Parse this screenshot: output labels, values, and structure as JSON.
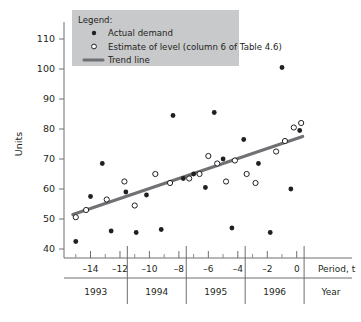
{
  "chart_data": {
    "type": "scatter",
    "title": "",
    "xlabel": "Period, t",
    "ylabel": "Units",
    "xlim": [
      -15.8,
      0.9
    ],
    "ylim": [
      37,
      113
    ],
    "grid": false,
    "x_ticks": [
      -14,
      -12,
      -10,
      -8,
      -6,
      -4,
      -2,
      0
    ],
    "x_tick_labels": [
      "–14",
      "–12",
      "–10",
      "–8",
      "–6",
      "–4",
      "–2",
      "0"
    ],
    "x_minor_ticks": [
      -15,
      -13,
      -11,
      -9,
      -7,
      -5,
      -3,
      -1
    ],
    "y_ticks": [
      40,
      50,
      60,
      70,
      80,
      90,
      100,
      110
    ],
    "y_tick_labels": [
      "40",
      "50",
      "60",
      "70",
      "80",
      "90",
      "100",
      "110"
    ],
    "second_axis_label": "Year",
    "year_bands": [
      {
        "label": "1993",
        "start": -15.8,
        "end": -11.5
      },
      {
        "label": "1994",
        "start": -11.5,
        "end": -7.5
      },
      {
        "label": "1995",
        "start": -7.5,
        "end": -3.5
      },
      {
        "label": "1996",
        "start": -3.5,
        "end": 0.5
      }
    ],
    "series": [
      {
        "name": "Actual demand",
        "marker": "filled-circle",
        "color": "#231f20",
        "points": [
          {
            "x": -15.0,
            "y": 42.5
          },
          {
            "x": -14.0,
            "y": 57.5
          },
          {
            "x": -13.2,
            "y": 68.5
          },
          {
            "x": -12.6,
            "y": 46.0
          },
          {
            "x": -11.6,
            "y": 59.0
          },
          {
            "x": -10.9,
            "y": 45.5
          },
          {
            "x": -10.2,
            "y": 58.0
          },
          {
            "x": -9.2,
            "y": 46.5
          },
          {
            "x": -8.4,
            "y": 84.5
          },
          {
            "x": -7.7,
            "y": 63.5
          },
          {
            "x": -7.0,
            "y": 65.0
          },
          {
            "x": -6.2,
            "y": 60.5
          },
          {
            "x": -5.6,
            "y": 85.5
          },
          {
            "x": -5.0,
            "y": 70.0
          },
          {
            "x": -4.4,
            "y": 47.0
          },
          {
            "x": -3.6,
            "y": 76.5
          },
          {
            "x": -2.6,
            "y": 68.5
          },
          {
            "x": -1.8,
            "y": 45.5
          },
          {
            "x": -1.0,
            "y": 100.5
          },
          {
            "x": -0.4,
            "y": 60.0
          },
          {
            "x": 0.2,
            "y": 79.5
          }
        ]
      },
      {
        "name": "Estimate of level (column 6 of Table 4.6)",
        "marker": "open-circle",
        "color": "#231f20",
        "points": [
          {
            "x": -15.0,
            "y": 50.6
          },
          {
            "x": -14.3,
            "y": 53.0
          },
          {
            "x": -12.9,
            "y": 56.5
          },
          {
            "x": -11.7,
            "y": 62.5
          },
          {
            "x": -11.0,
            "y": 54.5
          },
          {
            "x": -9.6,
            "y": 65.0
          },
          {
            "x": -8.6,
            "y": 62.0
          },
          {
            "x": -7.3,
            "y": 63.5
          },
          {
            "x": -6.6,
            "y": 65.0
          },
          {
            "x": -6.0,
            "y": 71.0
          },
          {
            "x": -5.4,
            "y": 68.5
          },
          {
            "x": -4.8,
            "y": 62.5
          },
          {
            "x": -4.2,
            "y": 69.5
          },
          {
            "x": -3.4,
            "y": 65.0
          },
          {
            "x": -2.8,
            "y": 62.0
          },
          {
            "x": -1.4,
            "y": 72.5
          },
          {
            "x": -0.8,
            "y": 76.0
          },
          {
            "x": -0.2,
            "y": 80.5
          },
          {
            "x": 0.3,
            "y": 82.0
          }
        ]
      }
    ],
    "trend_line": {
      "name": "Trend line",
      "color": "#6f7175",
      "start": {
        "x": -15.2,
        "y": 51.5
      },
      "end": {
        "x": 0.4,
        "y": 77.5
      }
    }
  },
  "legend": {
    "title": "Legend:",
    "items": [
      {
        "label": "Actual demand",
        "marker": "filled-circle"
      },
      {
        "label": "Estimate of level (column 6 of Table 4.6)",
        "marker": "open-circle"
      },
      {
        "label": "Trend line",
        "marker": "line"
      }
    ]
  }
}
